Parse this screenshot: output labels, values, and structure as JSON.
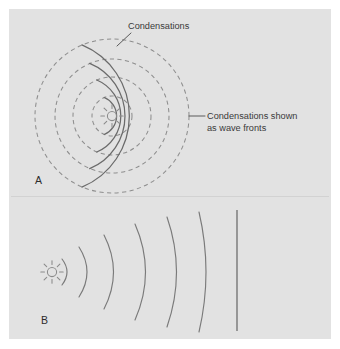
{
  "figure": {
    "background_color": "#e2e2e2",
    "page_color": "#ffffff",
    "dashed_stroke_color": "#8e8e8e",
    "solid_stroke_color": "#6b6b6b",
    "text_color": "#3a3a3a"
  },
  "annotations": {
    "condensations_label": "Condensations",
    "wave_fronts_label_line1": "Condensations shown",
    "wave_fronts_label_line2": "as wave fronts"
  },
  "panels": [
    {
      "letter": "A",
      "description": "spherical-wave-panel",
      "source": {
        "type": "sound-source-burst",
        "cx": 112,
        "cy": 116,
        "ring_radius": 4.6,
        "ray_count": 8
      },
      "wave_circles": [
        {
          "radius": 20,
          "dashed_arc": true,
          "solid_arc": true
        },
        {
          "radius": 39,
          "dashed_arc": true,
          "solid_arc": true
        },
        {
          "radius": 57,
          "dashed_arc": true,
          "solid_arc": true
        },
        {
          "radius": 77,
          "dashed_arc": true,
          "solid_arc": true
        }
      ]
    },
    {
      "letter": "B",
      "description": "plane-wave-flattening-panel",
      "source": {
        "type": "sound-source-burst",
        "cx": 52,
        "cy": 272,
        "ring_radius": 4.6,
        "ray_count": 8
      },
      "wave_fronts": [
        {
          "index": 1,
          "x_at_center": 70,
          "curvature": 10,
          "half_height": 13
        },
        {
          "index": 2,
          "x_at_center": 89,
          "curvature": 16,
          "half_height": 25
        },
        {
          "index": 3,
          "x_at_center": 113,
          "curvature": 19,
          "half_height": 37
        },
        {
          "index": 4,
          "x_at_center": 145,
          "curvature": 21,
          "half_height": 48
        },
        {
          "index": 5,
          "x_at_center": 175,
          "curvature": 20,
          "half_height": 55
        },
        {
          "index": 6,
          "x_at_center": 205,
          "curvature": 16,
          "half_height": 60
        }
      ],
      "plane_front": {
        "x": 237,
        "y_top": 210,
        "y_bottom": 331
      }
    }
  ]
}
